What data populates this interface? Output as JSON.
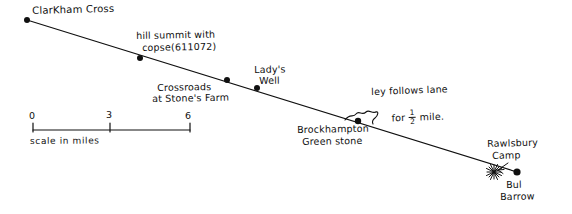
{
  "diagram": {
    "ink_color": "#101010",
    "background_color": "#ffffff",
    "ley_line": {
      "start": [
        27,
        20
      ],
      "end": [
        517,
        172
      ],
      "label": "ley-line"
    },
    "points": [
      {
        "id": "clarkham-cross",
        "label": "ClarKham Cross",
        "marker": "dot",
        "x": 27,
        "y": 20,
        "label_x": 32,
        "label_y": 7
      },
      {
        "id": "hill-summit-copse",
        "label": "hill summit with\ncopse(611072)",
        "line1": "hill summit with",
        "line2": "copse(611072)",
        "marker": "dot",
        "x": 140,
        "y": 58,
        "label_x": 138,
        "label_y": 33
      },
      {
        "id": "crossroads-stones-farm",
        "label": "Crossroads\nat Stone's Farm",
        "line1": "Crossroads",
        "line2": "at Stone's Farm",
        "marker": "dot",
        "x": 227,
        "y": 80,
        "label_x": 156,
        "label_y": 84
      },
      {
        "id": "ladys-well",
        "label": "Lady's\nWell",
        "line1": "Lady's",
        "line2": "Well",
        "marker": "dot",
        "x": 257,
        "y": 88,
        "label_x": 253,
        "label_y": 66
      },
      {
        "id": "brockhampton-green-stone",
        "label": "Brockhampton\nGreen stone",
        "line1": "Brockhampton",
        "line2": "Green stone",
        "marker": "dot",
        "x": 358,
        "y": 121,
        "label_x": 296,
        "label_y": 126
      },
      {
        "id": "rawlsbury-camp",
        "label": "Rawlsbury\nCamp",
        "line1": "Rawlsbury",
        "line2": "Camp",
        "marker": "starburst",
        "x": 494,
        "y": 172,
        "label_x": 487,
        "label_y": 140
      },
      {
        "id": "bul-barrow",
        "label": "Bul\nBarrow",
        "line1": "Bul",
        "line2": "Barrow",
        "marker": "dot",
        "x": 517,
        "y": 172,
        "label_x": 505,
        "label_y": 180
      }
    ],
    "annotation": {
      "id": "ley-follows-lane",
      "line1": "ley follows lane",
      "line2_prefix": "for ",
      "fraction_numerator": "1",
      "fraction_denominator": "2",
      "line2_suffix": " mile.",
      "label_x": 372,
      "label_y": 88,
      "brace_x": 352,
      "brace_y": 112
    },
    "scale_bar": {
      "id": "scale-bar",
      "caption": "scale in miles",
      "caption_x": 30,
      "caption_y": 140,
      "x_start": 33,
      "x_end": 190,
      "y": 130,
      "ticks": [
        {
          "label": "0",
          "x": 33,
          "label_x": 29,
          "label_y": 114
        },
        {
          "label": "3",
          "x": 110,
          "label_x": 106,
          "label_y": 113
        },
        {
          "label": "6",
          "x": 190,
          "label_x": 185,
          "label_y": 114
        }
      ]
    }
  }
}
